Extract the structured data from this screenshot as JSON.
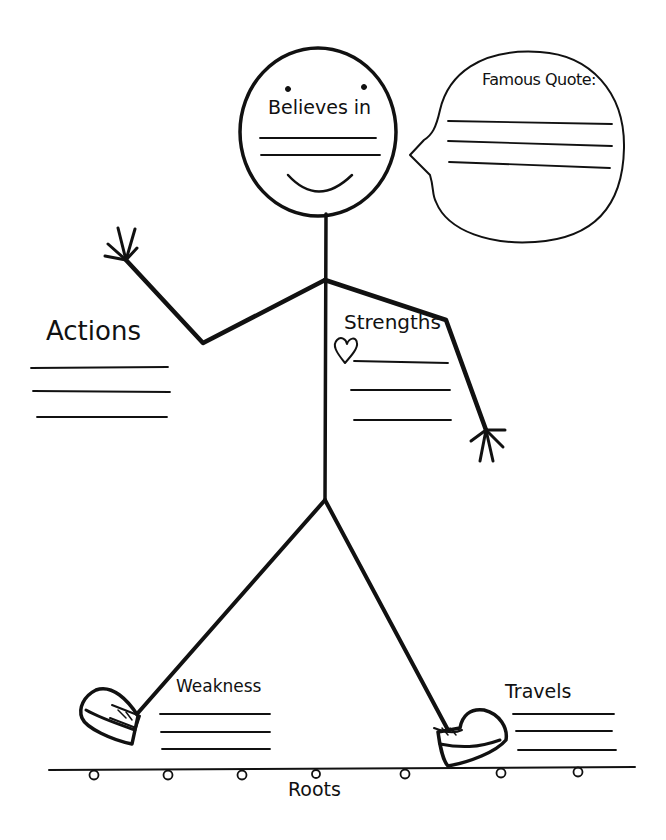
{
  "worksheet": {
    "head_label": "Believes in",
    "speech_bubble_label": "Famous Quote:",
    "left_label": "Actions",
    "chest_label": "Strengths",
    "left_foot_label": "Weakness",
    "right_foot_label": "Travels",
    "ground_label": "Roots"
  },
  "blank_lines": {
    "head": 2,
    "speech_bubble": 3,
    "actions": 3,
    "strengths": 3,
    "weakness": 3,
    "travels": 3
  },
  "colors": {
    "ink": "#111111",
    "paper": "#ffffff"
  }
}
